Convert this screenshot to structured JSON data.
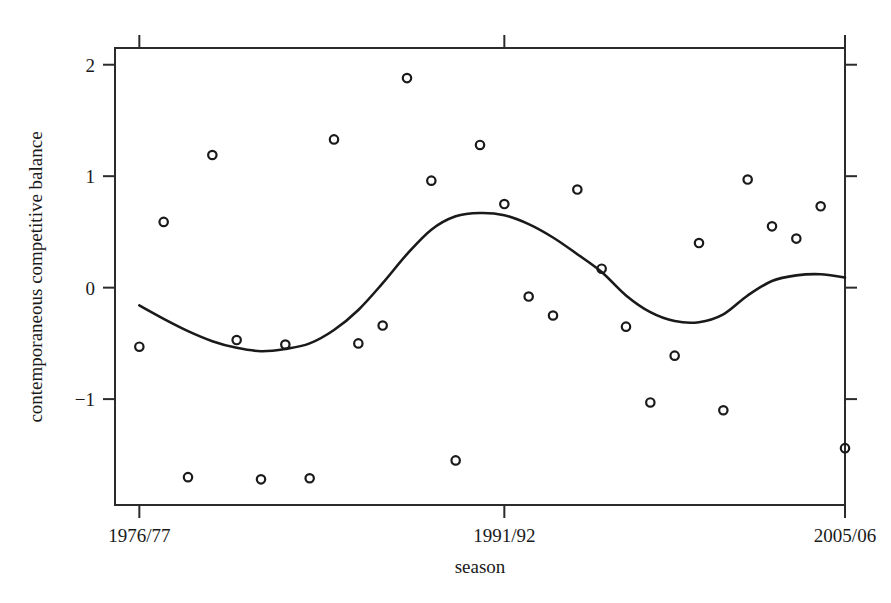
{
  "chart_data": {
    "type": "scatter",
    "title": "",
    "xlabel": "season",
    "ylabel": "contemporaneous competitive balance",
    "grid": false,
    "legend": null,
    "xlim": [
      0,
      30
    ],
    "ylim": [
      -1.95,
      2.15
    ],
    "xtick_positions": [
      1,
      16,
      30
    ],
    "xtick_labels": [
      "1976/77",
      "1991/92",
      "2005/06"
    ],
    "ytick_values": [
      2,
      1,
      0,
      -1
    ],
    "ytick_labels": [
      "2",
      "1",
      "0",
      "-1"
    ],
    "x": [
      1,
      2,
      3,
      4,
      5,
      6,
      7,
      8,
      9,
      10,
      11,
      12,
      13,
      14,
      15,
      16,
      17,
      18,
      19,
      20,
      21,
      22,
      23,
      24,
      25,
      26,
      27,
      28,
      29,
      30
    ],
    "categories": [
      "1976/77",
      "1977/78",
      "1978/79",
      "1979/80",
      "1980/81",
      "1981/82",
      "1982/83",
      "1983/84",
      "1984/85",
      "1985/86",
      "1986/87",
      "1987/88",
      "1988/89",
      "1989/90",
      "1990/91",
      "1991/92",
      "1992/93",
      "1993/94",
      "1994/95",
      "1995/96",
      "1996/97",
      "1997/98",
      "1998/99",
      "1999/00",
      "2000/01",
      "2001/02",
      "2002/03",
      "2003/04",
      "2004/05",
      "2005/06"
    ],
    "values": [
      -0.53,
      0.59,
      -1.7,
      1.19,
      -0.47,
      -1.72,
      -0.51,
      -1.71,
      1.33,
      -0.5,
      -0.34,
      1.88,
      0.96,
      -1.55,
      1.28,
      0.75,
      -0.08,
      -0.25,
      0.88,
      0.17,
      -0.35,
      -1.03,
      -0.61,
      0.4,
      -1.1,
      0.97,
      0.55,
      0.44,
      0.73,
      -1.44
    ],
    "series": [
      {
        "name": "observed competitive balance",
        "marker": "open-circle",
        "color": "#1a1a1a",
        "values": [
          -0.53,
          0.59,
          -1.7,
          1.19,
          -0.47,
          -1.72,
          -0.51,
          -1.71,
          1.33,
          -0.5,
          -0.34,
          1.88,
          0.96,
          -1.55,
          1.28,
          0.75,
          -0.08,
          -0.25,
          0.88,
          0.17,
          -0.35,
          -1.03,
          -0.61,
          0.4,
          -1.1,
          0.97,
          0.55,
          0.44,
          0.73,
          -1.44
        ]
      },
      {
        "name": "smoothed trend",
        "marker": "none",
        "type": "line",
        "color": "#1a1a1a",
        "values": [
          -0.16,
          -0.28,
          -0.39,
          -0.48,
          -0.54,
          -0.57,
          -0.55,
          -0.5,
          -0.38,
          -0.2,
          0.04,
          0.3,
          0.52,
          0.64,
          0.67,
          0.65,
          0.57,
          0.45,
          0.3,
          0.14,
          -0.07,
          -0.22,
          -0.3,
          -0.31,
          -0.24,
          -0.07,
          0.06,
          0.11,
          0.12,
          0.09
        ]
      }
    ]
  },
  "axes": {
    "ylabel": "contemporaneous competitive balance",
    "xlabel": "season"
  }
}
